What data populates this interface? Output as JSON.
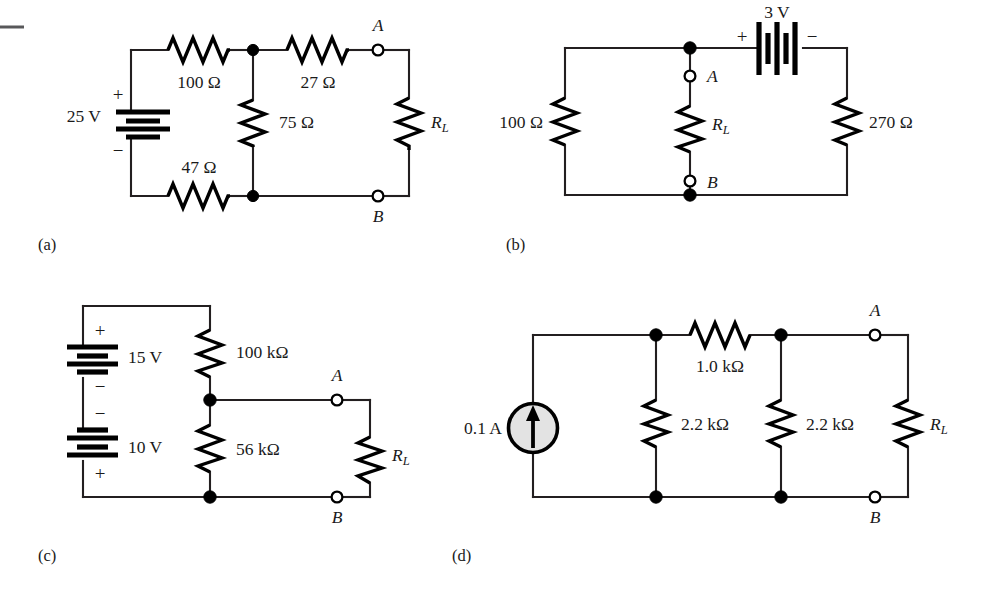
{
  "figure": {
    "subfigures": [
      {
        "id": "a",
        "label": "(a)"
      },
      {
        "id": "b",
        "label": "(b)"
      },
      {
        "id": "c",
        "label": "(c)"
      },
      {
        "id": "d",
        "label": "(d)"
      }
    ]
  },
  "circuit_a": {
    "caption": "(a)",
    "source_value": "25 V",
    "source_plus": "+",
    "source_minus": "−",
    "r_top_left": "100 Ω",
    "r_top_right": "27 Ω",
    "r_middle": "75 Ω",
    "r_bottom": "47 Ω",
    "load_label": "R",
    "load_sub": "L",
    "terminal_a": "A",
    "terminal_b": "B"
  },
  "circuit_b": {
    "caption": "(b)",
    "source_value": "3 V",
    "source_plus": "+",
    "source_minus": "−",
    "r_left": "100 Ω",
    "r_right": "270 Ω",
    "load_label": "R",
    "load_sub": "L",
    "terminal_a": "A",
    "terminal_b": "B"
  },
  "circuit_c": {
    "caption": "(c)",
    "source_top_value": "15 V",
    "source_top_plus": "+",
    "source_top_minus": "−",
    "source_bottom_value": "10 V",
    "source_bottom_minus": "−",
    "source_bottom_plus": "+",
    "r_top": "100 kΩ",
    "r_bottom": "56 kΩ",
    "load_label": "R",
    "load_sub": "L",
    "terminal_a": "A",
    "terminal_b": "B"
  },
  "circuit_d": {
    "caption": "(d)",
    "source_value": "0.1 A",
    "r_series": "1.0 kΩ",
    "r_left": "2.2 kΩ",
    "r_right": "2.2 kΩ",
    "load_label": "R",
    "load_sub": "L",
    "terminal_a": "A",
    "terminal_b": "B"
  },
  "colors": {
    "ink": "#231f20",
    "component": "#000000",
    "source_fill": "#e3e3e3",
    "background": "#ffffff"
  }
}
